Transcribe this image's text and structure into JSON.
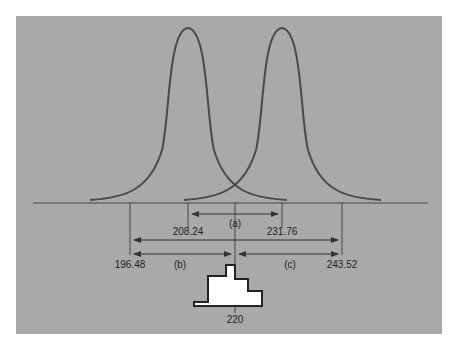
{
  "figure": {
    "background_color": "#a9a9a9",
    "line_color": "#4a4a4a",
    "curves": [
      {
        "name": "left-distribution",
        "center": 208.24
      },
      {
        "name": "right-distribution",
        "center": 231.76
      }
    ],
    "tick_values": {
      "inner_left": "208.24",
      "inner_right": "231.76",
      "outer_left": "196.48",
      "outer_right": "243.52",
      "center": "220"
    },
    "span_labels": {
      "a": "(a)",
      "b": "(b)",
      "c": "(c)"
    }
  }
}
